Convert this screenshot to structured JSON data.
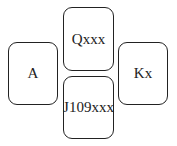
{
  "hands": {
    "north": "Qxxx",
    "west": "A",
    "east": "Kx",
    "south": "J109xxx"
  }
}
